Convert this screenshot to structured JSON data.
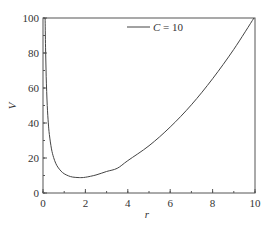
{
  "chart_data": {
    "type": "line",
    "title": "",
    "xlabel": "r",
    "ylabel": "V",
    "xlim": [
      0,
      10
    ],
    "ylim": [
      0,
      100
    ],
    "x_ticks": [
      0,
      2,
      4,
      6,
      8,
      10
    ],
    "y_ticks": [
      0,
      20,
      40,
      60,
      80,
      100
    ],
    "x_minor_step": 1,
    "y_minor_step": 10,
    "grid": false,
    "legend_position": "upper center",
    "series": [
      {
        "name": "C = 10",
        "legend_italic_part": "C",
        "legend_rest": " = 10",
        "color": "#444444",
        "x": [
          0.1,
          0.12,
          0.15,
          0.2,
          0.25,
          0.3,
          0.4,
          0.5,
          0.6,
          0.7,
          0.85,
          1.0,
          1.2,
          1.4,
          1.71,
          2.0,
          2.5,
          3.0,
          3.5,
          4.0,
          5.0,
          6.0,
          7.0,
          8.0,
          9.0,
          9.95
        ],
        "values": [
          100.0,
          83.3,
          66.7,
          50.0,
          40.1,
          33.4,
          25.2,
          20.3,
          17.0,
          14.8,
          12.5,
          11.0,
          9.8,
          9.1,
          8.8,
          9.0,
          10.3,
          12.3,
          14.1,
          18.5,
          27.0,
          37.7,
          50.4,
          65.3,
          82.1,
          100.0
        ]
      }
    ]
  }
}
